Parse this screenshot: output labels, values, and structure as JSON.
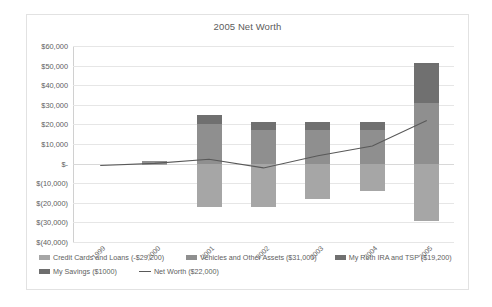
{
  "chart_data": {
    "type": "bar",
    "title": "2005 Net Worth",
    "xlabel": "",
    "ylabel": "",
    "categories": [
      "1999",
      "2000",
      "2001",
      "2002",
      "2003",
      "2004",
      "2005"
    ],
    "ylim": [
      -40000,
      60000
    ],
    "yticks": [
      60000,
      50000,
      40000,
      30000,
      20000,
      10000,
      0,
      -10000,
      -20000,
      -30000,
      -40000
    ],
    "ytick_labels": [
      "$60,000",
      "$50,000",
      "$40,000",
      "$30,000",
      "$20,000",
      "$10,000",
      "$-",
      "$(10,000)",
      "$(20,000)",
      "$(30,000)",
      "$(40,000)"
    ],
    "grid": true,
    "legend_position": "bottom",
    "stacked": true,
    "series": [
      {
        "name": "Credit Cards and Loans (-$29,200)",
        "kind": "bar",
        "color": "#a6a6a6",
        "values": [
          0,
          -800,
          -22000,
          -22000,
          -18000,
          -14000,
          -29200
        ]
      },
      {
        "name": "Vehicles and Other Assets ($31,000)",
        "kind": "bar",
        "color": "#8f8f8f",
        "values": [
          0,
          1200,
          20000,
          17000,
          17000,
          17000,
          31000
        ]
      },
      {
        "name": "My Roth IRA and TSP ($19,200)",
        "kind": "bar",
        "color": "#707070",
        "values": [
          0,
          0,
          5000,
          4000,
          4000,
          4000,
          19200
        ]
      },
      {
        "name": "My Savings ($1000)",
        "kind": "bar",
        "color": "#6e6e6e",
        "values": [
          0,
          0,
          0,
          0,
          0,
          0,
          1000
        ]
      },
      {
        "name": "Net Worth ($22,000)",
        "kind": "line",
        "color": "#595959",
        "values": [
          -1000,
          100,
          2200,
          -2200,
          4000,
          9000,
          22000
        ]
      }
    ]
  },
  "legend": {
    "rows": [
      [
        {
          "label": "Credit Cards and Loans (-$29,200)",
          "swatch": "s-credit",
          "marker": "square"
        },
        {
          "label": "Vehicles and Other Assets ($31,000)",
          "swatch": "s-vehicles",
          "marker": "square"
        },
        {
          "label": "My Roth IRA and TSP ($19,200)",
          "swatch": "s-roth",
          "marker": "square"
        }
      ],
      [
        {
          "label": "My Savings ($1000)",
          "swatch": "s-savings",
          "marker": "square"
        },
        {
          "label": "Net Worth ($22,000)",
          "swatch": "s-line",
          "marker": "line"
        }
      ]
    ]
  }
}
